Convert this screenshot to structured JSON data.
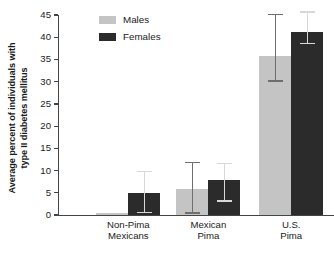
{
  "chart_data": {
    "type": "bar",
    "title": "",
    "subtitle": "",
    "xlabel": "",
    "ylabel": "Average percent of individuals with type II diabetes mellitus",
    "ylabel_lines": [
      "Average percent of individuals with",
      "type II diabetes mellitus"
    ],
    "ylim": [
      0,
      45
    ],
    "ytick_step": 5,
    "yticks": [
      0,
      5,
      10,
      15,
      20,
      25,
      30,
      35,
      40,
      45
    ],
    "ytick_labels": [
      "0",
      "5",
      "10",
      "15",
      "20",
      "25",
      "30",
      "35",
      "40",
      "45"
    ],
    "grid": false,
    "legend_position": "top-left-inside",
    "categories": [
      "Non-Pima Mexicans",
      "Mexican Pima",
      "U.S. Pima"
    ],
    "category_lines": [
      [
        "Non-Pima",
        "Mexicans"
      ],
      [
        "Mexican",
        "Pima"
      ],
      [
        "U.S.",
        "Pima"
      ]
    ],
    "series": [
      {
        "name": "Males",
        "color": "#c4c4c4",
        "values": [
          0.4,
          5.8,
          35.7
        ],
        "error_low": [
          0.4,
          0.3,
          30.0
        ],
        "error_high": [
          0.4,
          11.7,
          45.0
        ]
      },
      {
        "name": "Females",
        "color": "#2b2b2b",
        "values": [
          4.9,
          7.9,
          41.2
        ],
        "error_low": [
          0.4,
          3.0,
          38.5
        ],
        "error_high": [
          9.6,
          11.5,
          45.5
        ]
      }
    ],
    "annotations": []
  },
  "legend": {
    "items": [
      {
        "label": "Males",
        "color": "#c4c4c4"
      },
      {
        "label": "Females",
        "color": "#2b2b2b"
      }
    ]
  },
  "axis": {
    "y_title_line1": "Average percent of individuals with",
    "y_title_line2": "type II diabetes mellitus"
  }
}
